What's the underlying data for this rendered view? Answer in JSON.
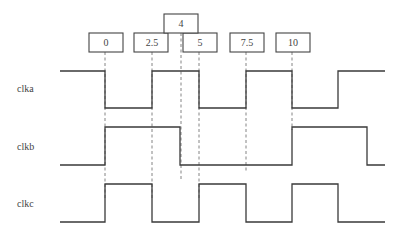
{
  "time_markers": [
    {
      "label": "0",
      "x": 105
    },
    {
      "label": "2.5",
      "x": 152
    },
    {
      "label": "4",
      "x": 181
    },
    {
      "label": "5",
      "x": 199
    },
    {
      "label": "7.5",
      "x": 246
    },
    {
      "label": "10",
      "x": 292
    }
  ],
  "signals": [
    {
      "name": "clka",
      "transitions": "high until 0, low 0–2.5, high 2.5–5, low 5–7.5, high 7.5–10, low 10–12.5, high after 12.5"
    },
    {
      "name": "clkb",
      "transitions": "low until 0, high 0–4, low 4–10, high 10–14, low after 14"
    },
    {
      "name": "clkc",
      "transitions": "low until 0, high 0–2.5, low 2.5–5, high 5–7.5, low 7.5–10, high 10–12.5, low after 12.5"
    }
  ],
  "labels": {
    "clka": "clka",
    "clkb": "clkb",
    "clkc": "clkc",
    "t0": "0",
    "t2_5": "2.5",
    "t4": "4",
    "t5": "5",
    "t7_5": "7.5",
    "t10": "10"
  }
}
